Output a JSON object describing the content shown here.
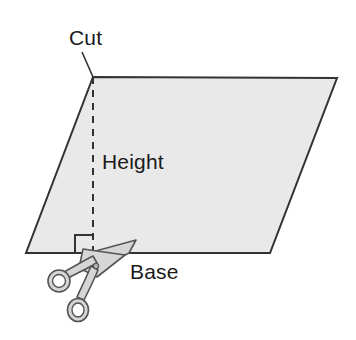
{
  "figure": {
    "background_color": "#ffffff"
  },
  "shape": {
    "name": "parallelogram",
    "fill_color": "#e9e9e9",
    "stroke_color": "#333333",
    "stroke_width": 2,
    "points": "93,77 337,78 270,253 26,253"
  },
  "height_line": {
    "stroke_color": "#333333",
    "dash_pattern": "7 6",
    "x": 93,
    "y_top": 77,
    "y_bottom": 253
  },
  "right_angle_marker": {
    "stroke_color": "#333333",
    "points": "75,253 75,235 93,235"
  },
  "leader_line": {
    "stroke_color": "#333333",
    "x1": 82,
    "y1": 52,
    "x2": 93,
    "y2": 77
  },
  "labels": {
    "cut": {
      "text": "Cut",
      "x": 69,
      "y": 45
    },
    "height": {
      "text": "Height",
      "x": 102,
      "y": 169
    },
    "base": {
      "text": "Base",
      "x": 130,
      "y": 279
    }
  },
  "scissors": {
    "fill_color": "#d6d6d6",
    "stroke_color": "#555555",
    "blade_upper_path": "M 92,252 L 135,241 L 128,252 L 96,268 Z",
    "blade_lower_path": "M 84,249 L 124,256 L 96,276 L 80,268 Z",
    "handle_upper_path": "M 95,266 L 72,278 L 66,274 L 90,259 Z",
    "handle_lower_path": "M 95,272 L 84,297 L 78,294 L 89,268 Z",
    "ring_upper": {
      "cx": 59,
      "cy": 281,
      "rx": 11,
      "ry": 11,
      "inner_rx": 6.5,
      "inner_ry": 6.5
    },
    "ring_lower": {
      "cx": 78,
      "cy": 310,
      "rx": 10.5,
      "ry": 11.5,
      "inner_rx": 6,
      "inner_ry": 7
    },
    "pivot": {
      "cx": 96,
      "cy": 266,
      "r": 2.5
    }
  }
}
